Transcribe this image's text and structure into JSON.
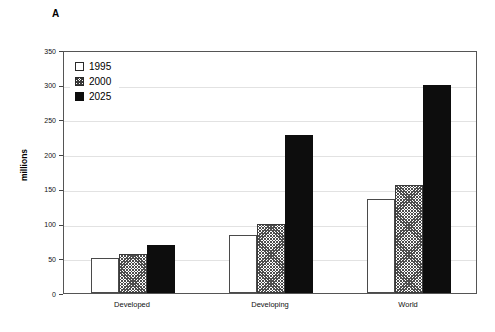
{
  "panel": {
    "label": "A"
  },
  "chart_data": {
    "type": "bar",
    "title": "",
    "xlabel": "",
    "ylabel": "millions",
    "ylim": [
      0,
      350
    ],
    "ytick_step": 50,
    "yticks": [
      0,
      50,
      100,
      150,
      200,
      250,
      300,
      350
    ],
    "ytick_labels": [
      "0",
      "50",
      "100",
      "150",
      "200",
      "250",
      "300",
      "350"
    ],
    "grid": true,
    "legend_position": "top-left",
    "categories": [
      "Developed",
      "Developing",
      "World"
    ],
    "series": [
      {
        "name": "1995",
        "fill": "white",
        "values": [
          50,
          84,
          135
        ]
      },
      {
        "name": "2000",
        "fill": "hatched",
        "values": [
          56,
          100,
          156
        ]
      },
      {
        "name": "2025",
        "fill": "black",
        "values": [
          69,
          228,
          300
        ]
      }
    ]
  },
  "colors": {
    "series_1995": "#ffffff",
    "series_2000": "#4d4d4d",
    "series_2025": "#0d0d0d",
    "axis": "#555555",
    "grid": "#e2e2e2"
  }
}
